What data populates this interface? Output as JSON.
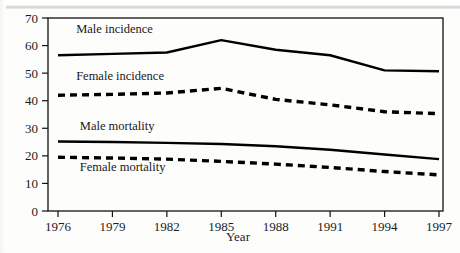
{
  "chart_data": {
    "type": "line",
    "title": "",
    "subtitle": "",
    "xlabel": "Year",
    "ylabel": "",
    "x": [
      1976,
      1979,
      1982,
      1985,
      1988,
      1991,
      1994,
      1997
    ],
    "xticklabels": [
      "1976",
      "1979",
      "1982",
      "1985",
      "1988",
      "1991",
      "1994",
      "1997"
    ],
    "yticklabels": [
      "0",
      "10",
      "20",
      "30",
      "40",
      "50",
      "60",
      "70"
    ],
    "yticks": [
      0,
      10,
      20,
      30,
      40,
      50,
      60,
      70
    ],
    "xlim": [
      1976,
      1997
    ],
    "ylim": [
      0,
      70
    ],
    "grid": false,
    "legend": "inline-labels",
    "series": [
      {
        "name": "Male incidence",
        "label": "Male incidence",
        "style": "solid",
        "color": "#000000",
        "label_x": 1977.0,
        "label_y": 64.5,
        "values": [
          56.5,
          57.0,
          57.5,
          62.0,
          58.5,
          56.5,
          51.0,
          50.7
        ]
      },
      {
        "name": "Female incidence",
        "label": "Female incidence",
        "style": "dashed",
        "color": "#000000",
        "label_x": 1977.0,
        "label_y": 47.5,
        "values": [
          42.0,
          42.3,
          42.8,
          44.5,
          40.5,
          38.5,
          36.0,
          35.3
        ]
      },
      {
        "name": "Male mortality",
        "label": "Male mortality",
        "style": "solid",
        "color": "#000000",
        "label_x": 1977.2,
        "label_y": 29.3,
        "values": [
          25.2,
          25.0,
          24.7,
          24.3,
          23.5,
          22.2,
          20.5,
          18.8
        ]
      },
      {
        "name": "Female mortality",
        "label": "Female mortality",
        "style": "dashed",
        "color": "#000000",
        "label_x": 1977.2,
        "label_y": 14.6,
        "values": [
          19.5,
          19.2,
          18.8,
          18.0,
          17.0,
          15.8,
          14.3,
          13.1
        ]
      }
    ]
  },
  "axes": {
    "x_axis_title": "Year"
  }
}
